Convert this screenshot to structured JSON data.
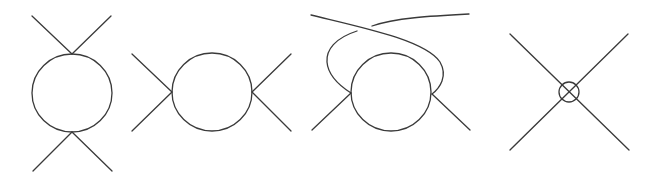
{
  "figure": {
    "diagrams": [
      {
        "id": "s-channel-vertical",
        "label": ""
      },
      {
        "id": "s-channel-horizontal",
        "label": ""
      },
      {
        "id": "crossed-channel",
        "label": ""
      },
      {
        "id": "contracted-vertex",
        "label": ""
      }
    ],
    "stroke_color": "#3a3a3a",
    "background_color": "#ffffff"
  }
}
